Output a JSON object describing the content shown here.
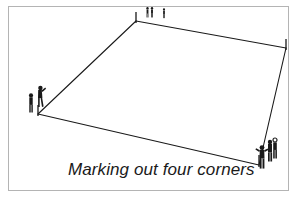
{
  "figure": {
    "caption": "Marking out four corners",
    "kind": "line-drawing",
    "ink_color": "#1a1a1a",
    "frame_color": "#b4b4b4",
    "background_color": "#ffffff",
    "plot": {
      "name": "marked-plot-outline",
      "shape": "quadrilateral",
      "corners": [
        {
          "id": "top-corner",
          "label": "top corner stake",
          "x": 136,
          "y": 21
        },
        {
          "id": "right-corner",
          "label": "right corner stake",
          "x": 286,
          "y": 48
        },
        {
          "id": "bottom-right-corner",
          "label": "bottom right corner stake",
          "x": 259,
          "y": 165
        },
        {
          "id": "left-corner",
          "label": "left corner stake",
          "x": 38,
          "y": 114
        }
      ],
      "stakes": [
        {
          "id": "stake-top",
          "x": 136,
          "y": 21,
          "height": 9
        },
        {
          "id": "stake-right",
          "x": 286,
          "y": 48,
          "height": 9
        },
        {
          "id": "stake-bottom-right",
          "x": 259,
          "y": 165,
          "height": 10
        },
        {
          "id": "stake-left",
          "x": 38,
          "y": 114,
          "height": 9
        }
      ]
    },
    "people": [
      {
        "id": "person-top-a",
        "group": "top",
        "x": 148,
        "y": 13,
        "scale": 0.62
      },
      {
        "id": "person-top-b",
        "group": "top",
        "x": 152,
        "y": 13,
        "scale": 0.62
      },
      {
        "id": "person-top-c",
        "group": "top",
        "x": 164,
        "y": 14,
        "scale": 0.58
      },
      {
        "id": "person-left-a",
        "group": "left",
        "x": 31,
        "y": 104,
        "scale": 0.95
      },
      {
        "id": "person-left-b",
        "group": "left",
        "x": 40,
        "y": 98,
        "scale": 1.0
      },
      {
        "id": "person-bottom-right-a",
        "group": "bottom-right",
        "x": 262,
        "y": 158,
        "scale": 1.05
      },
      {
        "id": "person-bottom-right-b",
        "group": "bottom-right",
        "x": 270,
        "y": 152,
        "scale": 1.0
      },
      {
        "id": "person-bottom-right-c",
        "group": "bottom-right",
        "x": 274,
        "y": 150,
        "scale": 0.95
      }
    ]
  }
}
